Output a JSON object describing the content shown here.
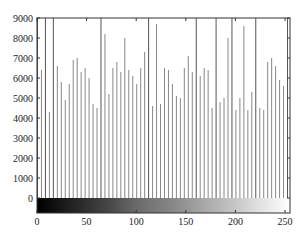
{
  "chart_data": {
    "type": "bar",
    "title": "",
    "xlabel": "",
    "ylabel": "",
    "xlim": [
      0,
      255
    ],
    "ylim": [
      0,
      9000
    ],
    "x_ticks": [
      "0",
      "50",
      "100",
      "150",
      "200",
      "250"
    ],
    "y_ticks": [
      "0",
      "1000",
      "2000",
      "3000",
      "4000",
      "5000",
      "6000",
      "7000",
      "8000",
      "9000"
    ],
    "grid": false,
    "colorbar": "grayscale 0-255 below x-axis",
    "bin_step": 4,
    "x": [
      0,
      4,
      8,
      12,
      16,
      20,
      24,
      28,
      32,
      36,
      40,
      44,
      48,
      52,
      56,
      60,
      64,
      68,
      72,
      76,
      80,
      84,
      88,
      92,
      96,
      100,
      104,
      108,
      112,
      116,
      120,
      124,
      128,
      132,
      136,
      140,
      144,
      148,
      152,
      156,
      160,
      164,
      168,
      172,
      176,
      180,
      184,
      188,
      192,
      196,
      200,
      204,
      208,
      212,
      216,
      220,
      224,
      228,
      232,
      236,
      240,
      244,
      248,
      252
    ],
    "values": [
      9000,
      6400,
      9000,
      4300,
      9000,
      6600,
      5800,
      4900,
      5700,
      6900,
      7000,
      6300,
      6500,
      6000,
      4700,
      4500,
      9000,
      8200,
      5200,
      6500,
      6800,
      6300,
      8000,
      6400,
      6100,
      5700,
      6500,
      7300,
      9000,
      4600,
      8700,
      4700,
      6500,
      6400,
      5700,
      5100,
      5000,
      6500,
      7100,
      6300,
      9000,
      6100,
      6500,
      6400,
      4500,
      9000,
      4800,
      5000,
      8000,
      9000,
      4400,
      5000,
      8600,
      4400,
      5300,
      9000,
      4500,
      4400,
      6800,
      7000,
      6600,
      5900,
      5600,
      9000
    ]
  }
}
